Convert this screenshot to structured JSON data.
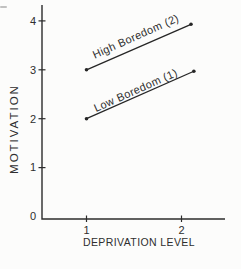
{
  "figure": {
    "background": "#fcfcfb",
    "ink_color": "#2c2c2c"
  },
  "chart_data": {
    "type": "line",
    "title": "",
    "xlabel": "DEPRIVATION LEVEL",
    "ylabel": "MOTIVATION",
    "x_ticks": [
      1,
      2
    ],
    "y_ticks": [
      0,
      1,
      2,
      3,
      4
    ],
    "xlim": [
      0.55,
      2.45
    ],
    "ylim": [
      0,
      4.4
    ],
    "grid": false,
    "legend_position": "labels-rotated-along-lines",
    "axis_color": "#2c2c2c",
    "series": [
      {
        "name": "High Boredom (2)",
        "color": "#262626",
        "points": [
          {
            "x": 1,
            "y": 3.0
          },
          {
            "x": 2.1,
            "y": 3.93
          }
        ],
        "values_at_ticks": [
          3,
          4
        ]
      },
      {
        "name": "Low Boredom (1)",
        "color": "#262626",
        "points": [
          {
            "x": 1,
            "y": 2.0
          },
          {
            "x": 2.13,
            "y": 2.97
          }
        ],
        "values_at_ticks": [
          2,
          3
        ]
      }
    ]
  }
}
